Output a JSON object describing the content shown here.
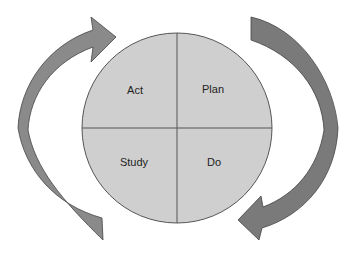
{
  "diagram": {
    "quadrants": {
      "top_left": "Act",
      "top_right": "Plan",
      "bottom_left": "Study",
      "bottom_right": "Do"
    },
    "arrows": [
      {
        "name": "left-arrow",
        "direction": "clockwise, upward toward Act/Plan"
      },
      {
        "name": "right-arrow",
        "direction": "clockwise, downward toward Do"
      }
    ],
    "colors": {
      "circle_fill": "#cfcfcf",
      "circle_stroke": "#555555",
      "arrow_left_fill": "#8a8a8a",
      "arrow_right_fill": "#7a7a7a",
      "arrow_stroke": "#444444"
    }
  }
}
